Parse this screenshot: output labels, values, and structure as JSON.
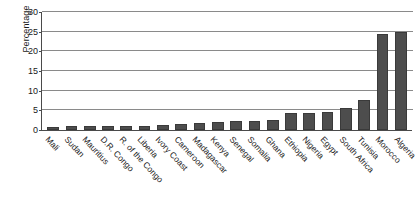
{
  "chart_data": {
    "type": "bar",
    "title": "",
    "subtitle": "",
    "xlabel": "",
    "ylabel": "Percentage",
    "ylim": [
      0,
      30
    ],
    "yticks": [
      0,
      5,
      10,
      15,
      20,
      25,
      30
    ],
    "ytick_labels": [
      "0",
      "5",
      "10",
      "15",
      "20",
      "25",
      "30"
    ],
    "grid": "horizontal",
    "legend": "none",
    "orientation": "vertical",
    "bar_color": "#4d4d4d",
    "categories": [
      "Mali",
      "Sudan",
      "Mauritius",
      "D.R. Congo",
      "R. of the Congo",
      "Liberia",
      "Ivory Coast",
      "Cameroon",
      "Madagascar",
      "Kenya",
      "Senegal",
      "Somalia",
      "Ghana",
      "Ethiopia",
      "Nigeria",
      "Egypt",
      "South Africa",
      "Tunisia",
      "Morocco",
      "Algeria"
    ],
    "values": [
      0.8,
      0.9,
      0.9,
      0.9,
      1.0,
      1.1,
      1.3,
      1.6,
      1.7,
      2.1,
      2.2,
      2.4,
      2.6,
      4.2,
      4.4,
      4.7,
      5.5,
      7.6,
      24.5,
      25.0
    ]
  }
}
